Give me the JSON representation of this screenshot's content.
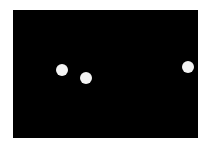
{
  "scene": {
    "background": "#000000",
    "frame": {
      "left": 13,
      "top": 10,
      "width": 185,
      "height": 128
    },
    "ball_color": "#f4f4f4",
    "balls": [
      {
        "cx": 62,
        "cy": 70,
        "d": 12
      },
      {
        "cx": 86,
        "cy": 78,
        "d": 12
      },
      {
        "cx": 188,
        "cy": 67,
        "d": 12
      }
    ]
  }
}
